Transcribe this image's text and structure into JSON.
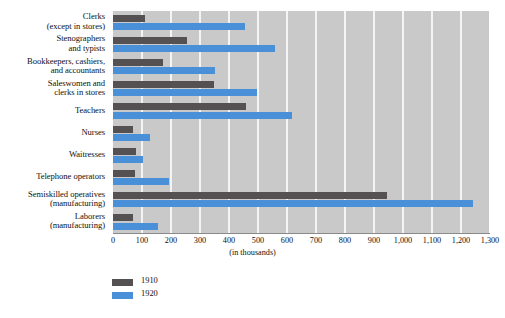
{
  "chart_data": {
    "type": "bar",
    "orientation": "horizontal",
    "title": "",
    "xlabel": "(in thousands)",
    "ylabel": "",
    "xlim": [
      0,
      1300
    ],
    "xticks": [
      0,
      100,
      200,
      300,
      400,
      500,
      600,
      700,
      800,
      900,
      1000,
      1100,
      1200,
      1300
    ],
    "xtick_labels": [
      "0",
      "100",
      "200",
      "300",
      "400",
      "500",
      "600",
      "700",
      "800",
      "900",
      "1,000",
      "1,100",
      "1,200",
      "1,300"
    ],
    "grid": true,
    "legend_position": "bottom-left",
    "categories": [
      "Clerks (except in stores)",
      "Stenographers and typists",
      "Bookkeepers, cashiers, and accountants",
      "Saleswomen and clerks in stores",
      "Teachers",
      "Nurses",
      "Waitresses",
      "Telephone operators",
      "Semiskilled operatives (manufacturing)",
      "Laborers (manufacturing)"
    ],
    "category_lines": [
      [
        "Clerks",
        "(except in stores)"
      ],
      [
        "Stenographers",
        "and typists"
      ],
      [
        "Bookkeepers, cashiers,",
        "and accountants"
      ],
      [
        "Saleswomen and",
        "clerks in stores"
      ],
      [
        "Teachers",
        ""
      ],
      [
        "Nurses",
        ""
      ],
      [
        "Waitresses",
        ""
      ],
      [
        "Telephone operators",
        ""
      ],
      [
        "Semiskilled operatives",
        "(manufacturing)"
      ],
      [
        "Laborers",
        "(manufacturing)"
      ]
    ],
    "series": [
      {
        "name": "1910",
        "color": "#555152",
        "values": [
          110,
          255,
          172,
          348,
          460,
          68,
          78,
          75,
          945,
          68
        ]
      },
      {
        "name": "1920",
        "color": "#4a90d9",
        "values": [
          455,
          558,
          350,
          498,
          618,
          126,
          102,
          192,
          1240,
          155
        ]
      }
    ]
  },
  "legend": {
    "items": [
      {
        "label": "1910",
        "color": "#555152"
      },
      {
        "label": "1920",
        "color": "#4a90d9"
      }
    ]
  },
  "colors": {
    "plot_background": "#c9c9c9",
    "gridline": "#f4f4f4",
    "page_background": "#ffffff",
    "series_1910": "#555152",
    "series_1920": "#4a90d9",
    "axis_line": "#8a8a8a"
  }
}
